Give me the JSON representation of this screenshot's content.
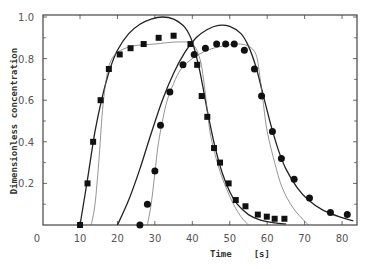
{
  "chart_data": {
    "type": "line",
    "title": "",
    "xlabel": "Time",
    "xlabel_unit": "[s]",
    "ylabel": "Dimensionless concentration",
    "xlim": [
      0,
      85
    ],
    "ylim": [
      0,
      1.0
    ],
    "x_ticks": [
      0,
      10,
      20,
      30,
      40,
      50,
      60,
      70,
      80
    ],
    "y_ticks": [
      0.2,
      0.4,
      0.6,
      0.8,
      1.0
    ],
    "y_tick_labels": [
      "0.2",
      "0.4",
      "0.6",
      "0.8",
      "1.0"
    ],
    "grid": false,
    "legend": null,
    "series": [
      {
        "name": "Measured (squares)",
        "kind": "scatter",
        "marker": "square",
        "points": [
          [
            10,
            0.0
          ],
          [
            12,
            0.2
          ],
          [
            13.5,
            0.4
          ],
          [
            15.5,
            0.6
          ],
          [
            17.7,
            0.75
          ],
          [
            20.6,
            0.82
          ],
          [
            23.5,
            0.85
          ],
          [
            27,
            0.87
          ],
          [
            31,
            0.9
          ],
          [
            35,
            0.91
          ],
          [
            39.5,
            0.87
          ],
          [
            41.3,
            0.77
          ],
          [
            42.5,
            0.62
          ],
          [
            44,
            0.52
          ],
          [
            45.8,
            0.37
          ],
          [
            47.4,
            0.3
          ],
          [
            49.7,
            0.2
          ],
          [
            51.6,
            0.12
          ],
          [
            54.2,
            0.09
          ],
          [
            57.5,
            0.05
          ],
          [
            59.9,
            0.04
          ],
          [
            62,
            0.03
          ],
          [
            64.6,
            0.03
          ]
        ]
      },
      {
        "name": "Measured (circles)",
        "kind": "scatter",
        "marker": "circle",
        "points": [
          [
            26,
            0.0
          ],
          [
            28,
            0.1
          ],
          [
            30,
            0.26
          ],
          [
            31.5,
            0.48
          ],
          [
            34,
            0.64
          ],
          [
            37.5,
            0.77
          ],
          [
            40.5,
            0.82
          ],
          [
            43.5,
            0.85
          ],
          [
            46.5,
            0.87
          ],
          [
            48.9,
            0.87
          ],
          [
            51.2,
            0.87
          ],
          [
            53.9,
            0.84
          ],
          [
            56.6,
            0.75
          ],
          [
            58.5,
            0.62
          ],
          [
            61.4,
            0.45
          ],
          [
            63.8,
            0.32
          ],
          [
            67.2,
            0.22
          ],
          [
            71.3,
            0.13
          ],
          [
            76.9,
            0.06
          ],
          [
            81.4,
            0.05
          ]
        ]
      },
      {
        "name": "Model A (thick, square run)",
        "kind": "line",
        "width": 1.3,
        "points": [
          [
            10,
            0.0
          ],
          [
            12,
            0.22
          ],
          [
            14,
            0.45
          ],
          [
            16,
            0.62
          ],
          [
            18,
            0.75
          ],
          [
            20,
            0.84
          ],
          [
            23,
            0.92
          ],
          [
            26,
            0.965
          ],
          [
            29,
            0.99
          ],
          [
            32,
            1.0
          ],
          [
            35,
            0.99
          ],
          [
            38,
            0.95
          ],
          [
            40,
            0.88
          ],
          [
            42,
            0.74
          ],
          [
            44,
            0.55
          ],
          [
            46,
            0.38
          ],
          [
            48,
            0.25
          ],
          [
            50,
            0.16
          ],
          [
            52,
            0.1
          ],
          [
            55,
            0.05
          ],
          [
            58,
            0.025
          ],
          [
            62,
            0.01
          ],
          [
            65,
            0.005
          ]
        ]
      },
      {
        "name": "Model B (thin, square run)",
        "kind": "line",
        "width": 0.7,
        "points": [
          [
            13,
            0.0
          ],
          [
            14,
            0.1
          ],
          [
            15,
            0.3
          ],
          [
            16,
            0.55
          ],
          [
            17,
            0.7
          ],
          [
            18,
            0.78
          ],
          [
            20,
            0.83
          ],
          [
            24,
            0.86
          ],
          [
            30,
            0.87
          ],
          [
            36,
            0.88
          ],
          [
            40,
            0.87
          ],
          [
            42,
            0.8
          ],
          [
            43,
            0.7
          ],
          [
            44,
            0.55
          ],
          [
            45,
            0.42
          ],
          [
            47,
            0.28
          ],
          [
            49,
            0.18
          ],
          [
            51,
            0.1
          ],
          [
            53,
            0.04
          ],
          [
            55,
            0.0
          ]
        ]
      },
      {
        "name": "Model A (thick, circle run)",
        "kind": "line",
        "width": 1.3,
        "points": [
          [
            20,
            0.0
          ],
          [
            23,
            0.12
          ],
          [
            26,
            0.27
          ],
          [
            29,
            0.44
          ],
          [
            32,
            0.6
          ],
          [
            35,
            0.73
          ],
          [
            38,
            0.83
          ],
          [
            41,
            0.9
          ],
          [
            44,
            0.94
          ],
          [
            47,
            0.96
          ],
          [
            50,
            0.955
          ],
          [
            53,
            0.92
          ],
          [
            55,
            0.86
          ],
          [
            57,
            0.76
          ],
          [
            59,
            0.62
          ],
          [
            61,
            0.48
          ],
          [
            63,
            0.36
          ],
          [
            65,
            0.27
          ],
          [
            68,
            0.18
          ],
          [
            71,
            0.12
          ],
          [
            75,
            0.07
          ],
          [
            80,
            0.035
          ],
          [
            83,
            0.02
          ]
        ]
      },
      {
        "name": "Model B (thin, circle run)",
        "kind": "line",
        "width": 0.7,
        "points": [
          [
            28,
            0.0
          ],
          [
            29,
            0.1
          ],
          [
            30,
            0.25
          ],
          [
            31,
            0.4
          ],
          [
            33,
            0.58
          ],
          [
            35,
            0.68
          ],
          [
            37,
            0.75
          ],
          [
            40,
            0.8
          ],
          [
            44,
            0.84
          ],
          [
            48,
            0.86
          ],
          [
            52,
            0.87
          ],
          [
            55,
            0.86
          ],
          [
            57,
            0.82
          ],
          [
            58,
            0.72
          ],
          [
            59,
            0.58
          ],
          [
            60,
            0.45
          ],
          [
            62,
            0.3
          ],
          [
            64,
            0.18
          ],
          [
            67,
            0.08
          ],
          [
            71,
            0.0
          ]
        ]
      }
    ]
  }
}
